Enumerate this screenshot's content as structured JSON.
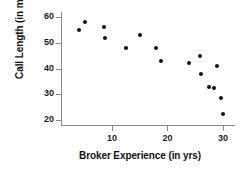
{
  "chart_data": {
    "type": "scatter",
    "title": "",
    "xlabel": "Broker Experience (in yrs)",
    "ylabel": "Call Length (in mins)",
    "xlim": [
      1,
      32
    ],
    "ylim": [
      18,
      62
    ],
    "xticks": [
      10,
      20,
      30
    ],
    "yticks": [
      20,
      30,
      40,
      50,
      60
    ],
    "xtick_labels": [
      "10",
      "20",
      "30"
    ],
    "ytick_labels": [
      "20",
      "30",
      "40",
      "50",
      "60"
    ],
    "grid": false,
    "legend": false,
    "marker": "filled-circle",
    "marker_color": "#111111",
    "points": [
      {
        "x": 4.0,
        "y": 55.0
      },
      {
        "x": 5.2,
        "y": 58.0
      },
      {
        "x": 8.5,
        "y": 56.0
      },
      {
        "x": 8.8,
        "y": 52.0
      },
      {
        "x": 12.5,
        "y": 48.0
      },
      {
        "x": 15.0,
        "y": 53.0
      },
      {
        "x": 18.0,
        "y": 48.0
      },
      {
        "x": 18.8,
        "y": 43.0
      },
      {
        "x": 23.8,
        "y": 42.0
      },
      {
        "x": 25.8,
        "y": 45.0
      },
      {
        "x": 26.0,
        "y": 38.0
      },
      {
        "x": 27.4,
        "y": 33.0
      },
      {
        "x": 28.4,
        "y": 32.3
      },
      {
        "x": 29.0,
        "y": 41.0
      },
      {
        "x": 29.6,
        "y": 28.5
      },
      {
        "x": 30.0,
        "y": 22.3
      }
    ]
  },
  "axes": {
    "y_title": "Call Length (in mins)",
    "x_title": "Broker Experience (in yrs)"
  }
}
